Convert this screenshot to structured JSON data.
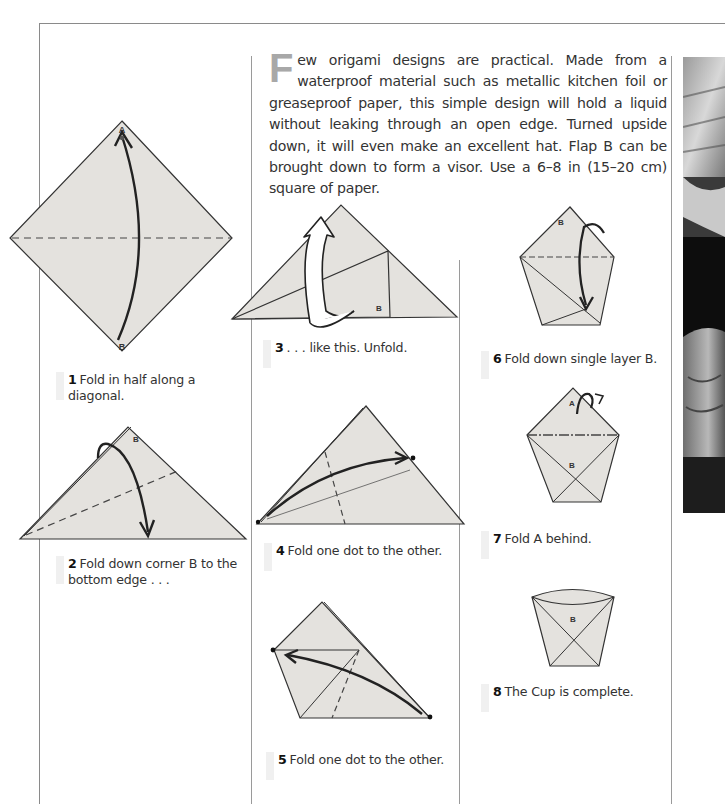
{
  "intro": {
    "drop_cap": "F",
    "text": "ew origami designs are practical. Made from a waterproof material such as metallic kitchen foil or greaseproof paper, this simple design will hold a liquid without leaking through an open edge. Turned upside down, it will even make an excellent hat. Flap B can be brought down to form a visor. Use a 6–8 in (15–20 cm) square of paper."
  },
  "steps": [
    {
      "num": "1",
      "text": "Fold in half along a diagonal."
    },
    {
      "num": "2",
      "text": "Fold down corner B to the bottom edge . . ."
    },
    {
      "num": "3",
      "text": ". . . like this. Unfold."
    },
    {
      "num": "4",
      "text": "Fold one dot to the other."
    },
    {
      "num": "5",
      "text": "Fold one dot to the other."
    },
    {
      "num": "6",
      "text": "Fold down single layer B."
    },
    {
      "num": "7",
      "text": "Fold A behind."
    },
    {
      "num": "8",
      "text": "The Cup is complete."
    }
  ],
  "labels": {
    "a": "A",
    "b": "B"
  },
  "colors": {
    "paper": "#e4e2de",
    "line": "#2b2b2b",
    "rule": "#8a8a8a",
    "dropcap": "#a8a8a8"
  }
}
